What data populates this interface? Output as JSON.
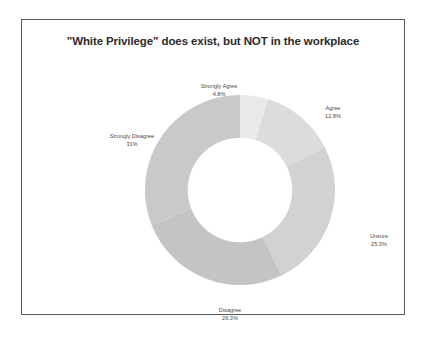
{
  "chart_data": {
    "type": "pie",
    "variant": "donut",
    "title": "\"White Privilege\" does exist, but NOT in the workplace",
    "xlabel": "",
    "ylabel": "",
    "legend": "none",
    "grid": false,
    "units": "percent",
    "start_angle_deg": 0,
    "direction": "clockwise",
    "inner_radius_ratio": 0.55,
    "categories": [
      "Strongly Agree",
      "Agree",
      "Unsure",
      "Disagree",
      "Strongly Disagree"
    ],
    "values": [
      4.8,
      12.8,
      25.3,
      26.3,
      31.0
    ],
    "total": 100.2,
    "colors": [
      "#e9e9e9",
      "#dcdcdc",
      "#d2d2d2",
      "#c4c4c4",
      "#c9c9c9"
    ],
    "slices": [
      {
        "label": "Strongly Agree",
        "pct_text": "4.8%",
        "value": 4.8,
        "color": "#e9e9e9"
      },
      {
        "label": "Agree",
        "pct_text": "12.8%",
        "value": 12.8,
        "color": "#dcdcdc"
      },
      {
        "label": "Unsure",
        "pct_text": "25.3%",
        "value": 25.3,
        "color": "#d2d2d2"
      },
      {
        "label": "Disagree",
        "pct_text": "26.3%",
        "value": 26.3,
        "color": "#c4c4c4"
      },
      {
        "label": "Strongly Disagree",
        "pct_text": "31%",
        "value": 31.0,
        "color": "#c9c9c9"
      }
    ]
  },
  "figure": {
    "border_color": "#5a5a5a",
    "background": "#ffffff",
    "title_color": "#2b2b2b",
    "label_color": "#4a4a4a"
  }
}
